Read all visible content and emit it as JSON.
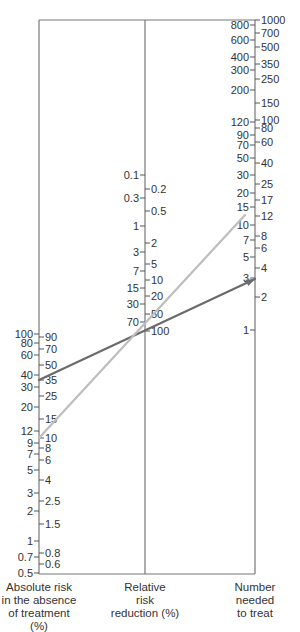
{
  "chart_data": {
    "type": "nomogram",
    "title": "",
    "axes": [
      {
        "name": "Absolute risk in the absence of treatment (%)",
        "x": 39,
        "left_ticks": [
          {
            "v": "100",
            "y": 334
          },
          {
            "v": "80",
            "y": 343
          },
          {
            "v": "60",
            "y": 355
          },
          {
            "v": "40",
            "y": 375
          },
          {
            "v": "30",
            "y": 387
          },
          {
            "v": "20",
            "y": 407
          },
          {
            "v": "12",
            "y": 431
          },
          {
            "v": "9",
            "y": 443
          },
          {
            "v": "7",
            "y": 454
          },
          {
            "v": "5",
            "y": 470
          },
          {
            "v": "3",
            "y": 493
          },
          {
            "v": "2",
            "y": 511
          },
          {
            "v": "1",
            "y": 541
          },
          {
            "v": "0.7",
            "y": 557
          },
          {
            "v": "0.5",
            "y": 573
          }
        ],
        "right_ticks": [
          {
            "v": "90",
            "y": 337
          },
          {
            "v": "70",
            "y": 349
          },
          {
            "v": "50",
            "y": 365
          },
          {
            "v": "35",
            "y": 380
          },
          {
            "v": "25",
            "y": 396
          },
          {
            "v": "15",
            "y": 419
          },
          {
            "v": "10",
            "y": 438
          },
          {
            "v": "8",
            "y": 448
          },
          {
            "v": "6",
            "y": 460
          },
          {
            "v": "4",
            "y": 480
          },
          {
            "v": "2.5",
            "y": 501
          },
          {
            "v": "1.5",
            "y": 524
          },
          {
            "v": "0.8",
            "y": 553
          },
          {
            "v": "0.6",
            "y": 564
          }
        ]
      },
      {
        "name": "Relative risk reduction (%)",
        "x": 145,
        "left_ticks": [
          {
            "v": "0.1",
            "y": 175
          },
          {
            "v": "0.3",
            "y": 198
          },
          {
            "v": "1",
            "y": 226
          },
          {
            "v": "3",
            "y": 252
          },
          {
            "v": "7",
            "y": 271
          },
          {
            "v": "15",
            "y": 288
          },
          {
            "v": "30",
            "y": 304
          },
          {
            "v": "70",
            "y": 322
          }
        ],
        "right_ticks": [
          {
            "v": "0.2",
            "y": 189
          },
          {
            "v": "0.5",
            "y": 211
          },
          {
            "v": "2",
            "y": 243
          },
          {
            "v": "5",
            "y": 264
          },
          {
            "v": "10",
            "y": 280
          },
          {
            "v": "20",
            "y": 296
          },
          {
            "v": "50",
            "y": 314
          },
          {
            "v": "100",
            "y": 331
          }
        ]
      },
      {
        "name": "Number needed to treat",
        "x": 255,
        "left_ticks": [
          {
            "v": "800",
            "y": 25
          },
          {
            "v": "600",
            "y": 40
          },
          {
            "v": "400",
            "y": 57
          },
          {
            "v": "300",
            "y": 70
          },
          {
            "v": "200",
            "y": 90
          },
          {
            "v": "120",
            "y": 122
          },
          {
            "v": "90",
            "y": 135
          },
          {
            "v": "70",
            "y": 145
          },
          {
            "v": "50",
            "y": 158
          },
          {
            "v": "30",
            "y": 175
          },
          {
            "v": "20",
            "y": 193
          },
          {
            "v": "15",
            "y": 207
          },
          {
            "v": "10",
            "y": 225
          },
          {
            "v": "7",
            "y": 240
          },
          {
            "v": "5",
            "y": 257
          },
          {
            "v": "3",
            "y": 278
          },
          {
            "v": "1",
            "y": 330
          }
        ],
        "right_ticks": [
          {
            "v": "1000",
            "y": 20
          },
          {
            "v": "700",
            "y": 33
          },
          {
            "v": "500",
            "y": 47
          },
          {
            "v": "350",
            "y": 64
          },
          {
            "v": "250",
            "y": 79
          },
          {
            "v": "150",
            "y": 103
          },
          {
            "v": "100",
            "y": 120
          },
          {
            "v": "80",
            "y": 128
          },
          {
            "v": "60",
            "y": 142
          },
          {
            "v": "40",
            "y": 163
          },
          {
            "v": "25",
            "y": 184
          },
          {
            "v": "17",
            "y": 200
          },
          {
            "v": "12",
            "y": 216
          },
          {
            "v": "8",
            "y": 236
          },
          {
            "v": "6",
            "y": 248
          },
          {
            "v": "4",
            "y": 268
          },
          {
            "v": "2",
            "y": 297
          }
        ]
      }
    ],
    "series": [
      {
        "name": "dark-line",
        "color": "#6b6b6b",
        "from": {
          "axis": "Absolute risk",
          "value": "35",
          "x": 39,
          "y": 380
        },
        "to": {
          "axis": "Number needed to treat",
          "value": "3",
          "x": 255,
          "y": 279
        },
        "arrow": true
      },
      {
        "name": "light-line",
        "color": "#bdbdbd",
        "from": {
          "axis": "Absolute risk",
          "value": "10",
          "x": 39,
          "y": 438
        },
        "to": {
          "axis": "Number needed to treat",
          "value": "12",
          "x": 245,
          "y": 215
        },
        "arrow": false
      }
    ],
    "frame": {
      "top_y": 20,
      "bottom_y": 574
    },
    "grid": false,
    "legend": null
  },
  "labels": {
    "left": [
      "Absolute risk",
      "in the absence",
      "of treatment (%)"
    ],
    "middle": [
      "Relative",
      "risk",
      "reduction (%)"
    ],
    "right": [
      "Number",
      "needed",
      "to treat"
    ]
  }
}
